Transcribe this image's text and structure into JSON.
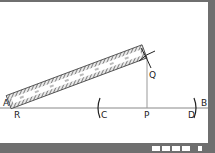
{
  "diagram": {
    "type": "geometric-construction",
    "points": {
      "A": "A",
      "B": "B",
      "R": "R",
      "C": "C",
      "P": "P",
      "D": "D",
      "Q": "Q"
    },
    "colors": {
      "background": "#6f6f6f",
      "panel": "#ffffff",
      "line": "#777777",
      "ruler_hatch": "#555555",
      "arc": "#222222"
    }
  },
  "footer": {
    "step_label": "STEP 4"
  }
}
